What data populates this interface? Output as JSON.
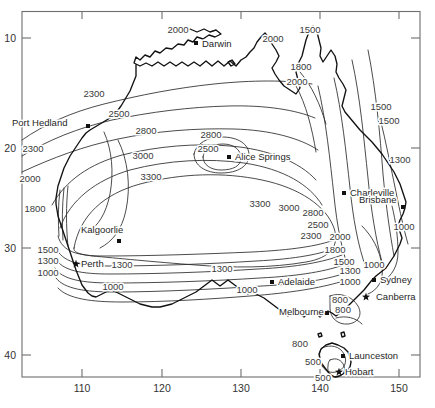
{
  "figure": {
    "type": "contour-map",
    "region": "Australia"
  },
  "axes": {
    "x": {
      "label": "",
      "ticks": [
        "110",
        "120",
        "130",
        "140",
        "150"
      ],
      "tick_values": [
        110,
        120,
        130,
        140,
        150
      ],
      "range": [
        106,
        156
      ]
    },
    "y": {
      "label": "",
      "ticks": [
        "10",
        "20",
        "30",
        "40"
      ],
      "tick_values": [
        10,
        20,
        30,
        40
      ],
      "range": [
        7.5,
        43.5
      ]
    },
    "frame": "box"
  },
  "chart_data": {
    "type": "contour",
    "title": "",
    "xlabel": "",
    "ylabel": "",
    "xlim": [
      106,
      156
    ],
    "ylim": [
      43.5,
      7.5
    ],
    "grid": false,
    "legend": "none",
    "contour_levels": [
      500,
      800,
      1000,
      1300,
      1500,
      1800,
      2000,
      2300,
      2500,
      2800,
      3000,
      3300
    ],
    "center_maximum_level": 3300,
    "central_closed_low": [
      2800,
      2500
    ],
    "labels": [
      {
        "text": "2000",
        "x": 178,
        "y": 33
      },
      {
        "text": "2000",
        "x": 273,
        "y": 42
      },
      {
        "text": "1500",
        "x": 310,
        "y": 33
      },
      {
        "text": "1800",
        "x": 301,
        "y": 70
      },
      {
        "text": "2000",
        "x": 297,
        "y": 85
      },
      {
        "text": "1500",
        "x": 381,
        "y": 110
      },
      {
        "text": "1500",
        "x": 389,
        "y": 124
      },
      {
        "text": "2300",
        "x": 94,
        "y": 97
      },
      {
        "text": "2500",
        "x": 119,
        "y": 117
      },
      {
        "text": "2800",
        "x": 146,
        "y": 134
      },
      {
        "text": "2800",
        "x": 211,
        "y": 138
      },
      {
        "text": "2500",
        "x": 208,
        "y": 152
      },
      {
        "text": "2300",
        "x": 33,
        "y": 152
      },
      {
        "text": "1300",
        "x": 400,
        "y": 163
      },
      {
        "text": "3000",
        "x": 143,
        "y": 159
      },
      {
        "text": "3300",
        "x": 151,
        "y": 180
      },
      {
        "text": "2000",
        "x": 30,
        "y": 182
      },
      {
        "text": "1800",
        "x": 35,
        "y": 212
      },
      {
        "text": "3300",
        "x": 260,
        "y": 207
      },
      {
        "text": "3000",
        "x": 289,
        "y": 211
      },
      {
        "text": "2800",
        "x": 313,
        "y": 216
      },
      {
        "text": "2500",
        "x": 318,
        "y": 228
      },
      {
        "text": "2300",
        "x": 311,
        "y": 239
      },
      {
        "text": "2000",
        "x": 340,
        "y": 240
      },
      {
        "text": "1800",
        "x": 335,
        "y": 253
      },
      {
        "text": "1000",
        "x": 404,
        "y": 230
      },
      {
        "text": "1500",
        "x": 48,
        "y": 253
      },
      {
        "text": "1300",
        "x": 48,
        "y": 264
      },
      {
        "text": "1000",
        "x": 48,
        "y": 276
      },
      {
        "text": "1300",
        "x": 122,
        "y": 268
      },
      {
        "text": "1000",
        "x": 113,
        "y": 290
      },
      {
        "text": "1300",
        "x": 222,
        "y": 272
      },
      {
        "text": "1000",
        "x": 247,
        "y": 293
      },
      {
        "text": "1500",
        "x": 344,
        "y": 265
      },
      {
        "text": "1300",
        "x": 350,
        "y": 274
      },
      {
        "text": "1000",
        "x": 350,
        "y": 285
      },
      {
        "text": "1000",
        "x": 374,
        "y": 268
      },
      {
        "text": "800",
        "x": 340,
        "y": 303
      },
      {
        "text": "800",
        "x": 343,
        "y": 313
      },
      {
        "text": "800",
        "x": 300,
        "y": 347
      },
      {
        "text": "500",
        "x": 313,
        "y": 365
      },
      {
        "text": "500",
        "x": 323,
        "y": 381
      }
    ]
  },
  "cities": [
    {
      "name": "Darwin",
      "marker": "dot",
      "x": 196,
      "y": 43,
      "label_dx": 6,
      "label_dy": 4
    },
    {
      "name": "Port Hedland",
      "marker": "dot",
      "x": 88,
      "y": 126,
      "label_dx": -76,
      "label_dy": 0
    },
    {
      "name": "Alice Springs",
      "marker": "dot",
      "x": 229,
      "y": 157,
      "label_dx": 6,
      "label_dy": 3
    },
    {
      "name": "Charleville",
      "marker": "dot",
      "x": 344,
      "y": 193,
      "label_dx": 6,
      "label_dy": 3
    },
    {
      "name": "Brisbane",
      "marker": "dot",
      "x": 403,
      "y": 207,
      "label_dx": -44,
      "label_dy": -4
    },
    {
      "name": "Kalgoorlie",
      "marker": "dot",
      "x": 119,
      "y": 241,
      "label_dx": -38,
      "label_dy": -8
    },
    {
      "name": "Perth",
      "marker": "star",
      "x": 76,
      "y": 264,
      "label_dx": 5,
      "label_dy": 3
    },
    {
      "name": "Adelaide",
      "marker": "dot",
      "x": 272,
      "y": 282,
      "label_dx": 6,
      "label_dy": 3
    },
    {
      "name": "Sydney",
      "marker": "dot",
      "x": 374,
      "y": 280,
      "label_dx": 6,
      "label_dy": 3
    },
    {
      "name": "Canberra",
      "marker": "star",
      "x": 366,
      "y": 297,
      "label_dx": 10,
      "label_dy": 3
    },
    {
      "name": "Melbourne",
      "marker": "dot",
      "x": 327,
      "y": 313,
      "label_dx": -48,
      "label_dy": 2
    },
    {
      "name": "Launceston",
      "marker": "dot",
      "x": 343,
      "y": 356,
      "label_dx": 6,
      "label_dy": 3
    },
    {
      "name": "Hobart",
      "marker": "star",
      "x": 339,
      "y": 372,
      "label_dx": 6,
      "label_dy": 3
    }
  ],
  "caption": {
    "text": ""
  },
  "colors": {
    "frame": "#6e6e6e",
    "coast": "#111111",
    "contour": "#2a2a2a",
    "text": "#2b2b2b",
    "background": "#ffffff"
  }
}
